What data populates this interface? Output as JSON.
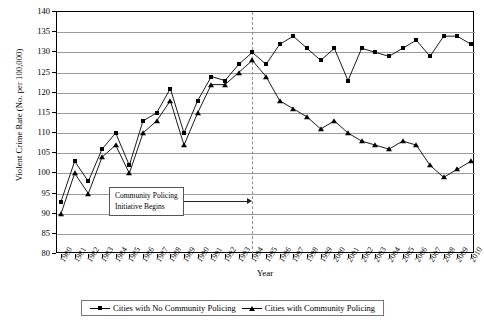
{
  "chart_data": {
    "type": "line",
    "title": "",
    "xlabel": "Year",
    "ylabel": "Violent Crime Rate (No. per 100,000)",
    "ylim": [
      80,
      140
    ],
    "ytick_step": 5,
    "yticks": [
      80,
      85,
      90,
      95,
      100,
      105,
      110,
      115,
      120,
      125,
      130,
      135,
      140
    ],
    "grid": true,
    "legend_position": "bottom",
    "categories": [
      "1980",
      "1981",
      "1982",
      "1983",
      "1984",
      "1985",
      "1986",
      "1987",
      "1988",
      "1989",
      "1990",
      "1991",
      "1992",
      "1993",
      "1994",
      "1995",
      "1996",
      "1997",
      "1998",
      "1999",
      "2000",
      "2001",
      "2002",
      "2003",
      "2004",
      "2005",
      "2006",
      "2007",
      "2008",
      "2009",
      "2010"
    ],
    "series": [
      {
        "name": "Cities with No Community Policing",
        "marker": "square",
        "values": [
          93,
          103,
          98,
          106,
          110,
          102,
          113,
          115,
          121,
          110,
          118,
          124,
          123,
          127,
          130,
          127,
          132,
          134,
          131,
          128,
          131,
          123,
          131,
          130,
          129,
          131,
          133,
          129,
          134,
          134,
          132
        ]
      },
      {
        "name": "Cities with Community Policing",
        "marker": "triangle",
        "values": [
          90,
          100,
          95,
          104,
          107,
          100,
          110,
          113,
          118,
          107,
          115,
          122,
          122,
          125,
          128,
          124,
          118,
          116,
          114,
          111,
          113,
          110,
          108,
          107,
          106,
          108,
          107,
          102,
          99,
          101,
          103
        ]
      }
    ],
    "annotation": {
      "text_line1": "Community Policing",
      "text_line2": "Initiative Begins",
      "marker_year": "1994"
    }
  }
}
